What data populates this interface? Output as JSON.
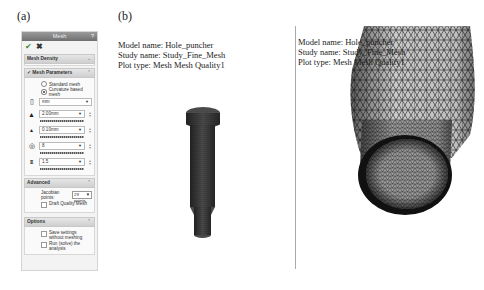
{
  "labels": {
    "a": "(a)",
    "b": "(b)"
  },
  "panel": {
    "title": "Mesh",
    "help_icon": "?",
    "ok_icon": "checkmark-icon",
    "cancel_icon": "x-icon",
    "sections": {
      "mesh_density": {
        "title": "Mesh Density",
        "chevron": "⌄"
      },
      "mesh_parameters": {
        "title": "Mesh Parameters",
        "radios": [
          {
            "label": "Standard mesh",
            "selected": false
          },
          {
            "label": "Curvature based mesh",
            "selected": true
          }
        ],
        "unit": "mm",
        "max_element_size": "2.00mm",
        "min_element_size": "0.10mm",
        "min_elements_in_circle": "8",
        "growth_ratio": "1.5"
      },
      "advanced": {
        "title": "Advanced",
        "jacobian_label": "Jacobian points:",
        "jacobian_value": "29 points",
        "draft_quality_label": "Draft Quality Mesh"
      },
      "options": {
        "title": "Options",
        "save_settings_label": "Save settings without meshing",
        "run_label": "Run (solve) the analysis"
      }
    }
  },
  "plot_info_b": {
    "model": "Model name: Hole_puncher",
    "study": "Study name: Study_Fine_Mesh",
    "plot": "Plot type: Mesh Mesh Quality1"
  },
  "plot_info_zoom": {
    "model": "Model name: Hole_puncher",
    "study": "Study name: Study_Fine_Mesh",
    "plot": "Plot type: Mesh Mesh Quality1"
  },
  "colors": {
    "title_bar": "#7a7a7a",
    "ok_green": "#3a8a3a",
    "panel_bg": "#f3f3f3"
  }
}
